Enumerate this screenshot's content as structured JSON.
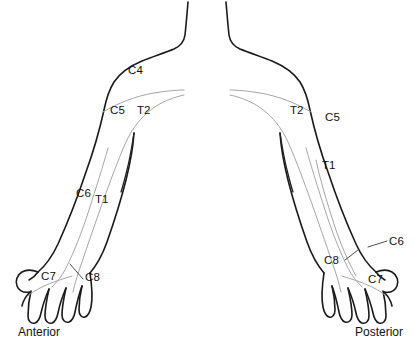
{
  "figure": {
    "background_color": "#ffffff",
    "outline_color": "#1a1a1a",
    "dermatome_line_color": "#a6a6a6",
    "label_color": "#111111"
  },
  "views": {
    "anterior": {
      "caption": "Anterior",
      "labels": [
        {
          "text": "C4",
          "x": 128,
          "y": 65
        },
        {
          "text": "C5",
          "x": 110,
          "y": 105
        },
        {
          "text": "T2",
          "x": 137,
          "y": 105
        },
        {
          "text": "C6",
          "x": 76,
          "y": 188
        },
        {
          "text": "T1",
          "x": 95,
          "y": 194
        },
        {
          "text": "C7",
          "x": 41,
          "y": 271
        },
        {
          "text": "C8",
          "x": 85,
          "y": 272
        }
      ]
    },
    "posterior": {
      "caption": "Posterior",
      "labels": [
        {
          "text": "T2",
          "x": 290,
          "y": 105
        },
        {
          "text": "C5",
          "x": 325,
          "y": 112
        },
        {
          "text": "T1",
          "x": 322,
          "y": 160
        },
        {
          "text": "C6",
          "x": 389,
          "y": 236
        },
        {
          "text": "C8",
          "x": 324,
          "y": 255
        },
        {
          "text": "C7",
          "x": 368,
          "y": 274
        }
      ]
    }
  },
  "dermatome_segments": [
    "C4",
    "C5",
    "C6",
    "C7",
    "C8",
    "T1",
    "T2"
  ]
}
